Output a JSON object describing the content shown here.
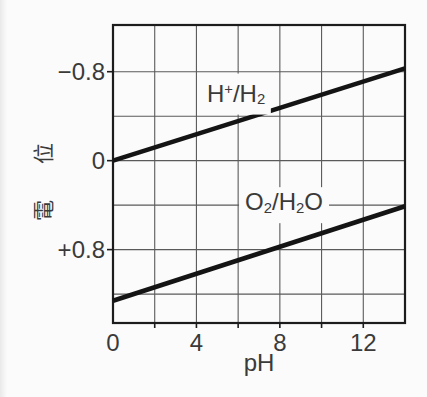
{
  "page": {
    "background": "#fbfbfb"
  },
  "chart_data": {
    "type": "line",
    "title": "",
    "xlabel": "pH",
    "ylabel": "電位",
    "xlim": [
      0,
      14
    ],
    "ylim": [
      -1.22,
      1.46
    ],
    "y_axis_inverted": true,
    "grid": true,
    "legend_position": "none",
    "x_gridlines": [
      2,
      4,
      6,
      8,
      10,
      12
    ],
    "y_gridlines": [
      -0.8,
      -0.4,
      0,
      0.4,
      0.8,
      1.2
    ],
    "x_ticks": [
      {
        "v": 0,
        "label": "0"
      },
      {
        "v": 4,
        "label": "4"
      },
      {
        "v": 8,
        "label": "8"
      },
      {
        "v": 12,
        "label": "12"
      }
    ],
    "y_ticks": [
      {
        "v": -0.8,
        "label": "−0.8"
      },
      {
        "v": 0,
        "label": "0"
      },
      {
        "v": 0.8,
        "label": "+0.8"
      }
    ],
    "series": [
      {
        "name": "H+/H2",
        "points": [
          [
            0,
            0
          ],
          [
            14,
            -0.83
          ]
        ]
      },
      {
        "name": "O2/H2O",
        "points": [
          [
            0,
            1.26
          ],
          [
            14,
            0.41
          ]
        ]
      }
    ],
    "annotations": [
      {
        "name": "H+/H2",
        "anchor": [
          5.9,
          -0.6
        ],
        "parts": [
          {
            "t": "H"
          },
          {
            "t": "+",
            "s": "sup"
          },
          {
            "t": "/H"
          },
          {
            "t": "2",
            "s": "sub"
          }
        ]
      },
      {
        "name": "O2/H2O",
        "anchor": [
          8.2,
          0.4
        ],
        "parts": [
          {
            "t": "O"
          },
          {
            "t": "2",
            "s": "sub"
          },
          {
            "t": "/H"
          },
          {
            "t": "2",
            "s": "sub"
          },
          {
            "t": "O"
          }
        ]
      }
    ],
    "colors": {
      "frame": "#1c1c1c",
      "grid": "#5a5a5a",
      "line": "#141414",
      "text": "#3a3a3a",
      "background": "#fbfbfb"
    }
  }
}
